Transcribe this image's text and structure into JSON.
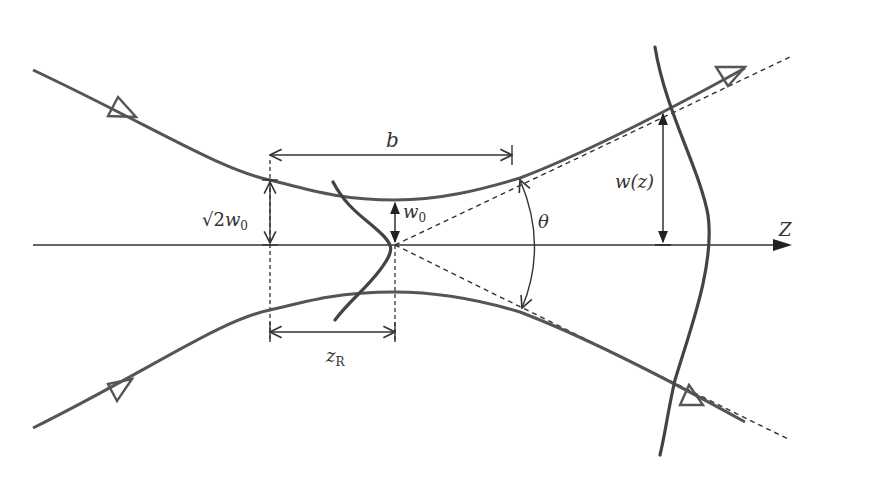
{
  "diagram": {
    "colors": {
      "beam": "#555555",
      "axis": "#333333",
      "profile": "#444444",
      "background": "#ffffff"
    },
    "labels": {
      "b": "b",
      "sqrt2w0_prefix": "√2",
      "sqrt2w0_var": "w",
      "sqrt2w0_sub": "0",
      "w0_var": "w",
      "w0_sub": "0",
      "wz": "w(z)",
      "theta": "θ",
      "z_axis": "Z",
      "zR_var": "z",
      "zR_sub": "R"
    },
    "elements": [
      "Upper beam envelope with incoming and outgoing arrows",
      "Lower beam envelope with incoming and outgoing arrows",
      "Optical axis Z",
      "Asymptote lines (dashed) from waist",
      "Gaussian transverse profile at waist",
      "Gaussian transverse profile at distance z",
      "Confocal parameter b",
      "Rayleigh range z_R",
      "Waist radius w0",
      "Beam radius √2 w0 at z_R",
      "Beam radius w(z)",
      "Divergence angle θ"
    ]
  }
}
